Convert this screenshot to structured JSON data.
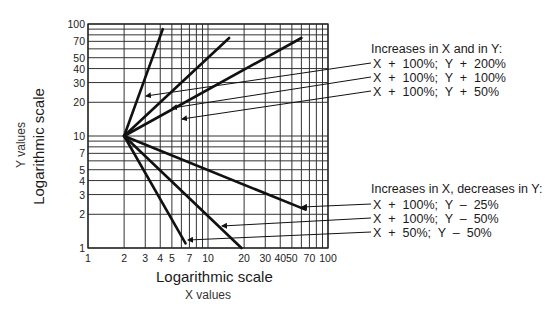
{
  "chart_data": {
    "type": "line",
    "title": "",
    "xlabel": "Logarithmic scale",
    "xsublabel": "X values",
    "ylabel": "Logarithmic scale",
    "ysublabel": "Y values",
    "xscale": "log",
    "yscale": "log",
    "xlim": [
      1,
      100
    ],
    "ylim": [
      1,
      100
    ],
    "grid": true,
    "x_ticks": [
      1,
      2,
      3,
      4,
      5,
      7,
      10,
      20,
      30,
      40,
      50,
      70,
      100
    ],
    "y_ticks": [
      1,
      2,
      3,
      4,
      5,
      7,
      10,
      20,
      30,
      40,
      50,
      70,
      100
    ],
    "x_tick_labels": [
      "1",
      "2",
      "3",
      "4",
      "5",
      "7",
      "10",
      "20",
      "30",
      "40",
      "50",
      "70",
      "100"
    ],
    "y_tick_labels": [
      "1",
      "2",
      "3",
      "4",
      "5",
      "7",
      "10",
      "20",
      "30",
      "40",
      "50",
      "70",
      "100"
    ],
    "origin": {
      "x": 2,
      "y": 10
    },
    "series": [
      {
        "name": "X + 100%; Y + 200%",
        "group": "increase",
        "x": [
          2,
          4.2
        ],
        "y": [
          10,
          90
        ]
      },
      {
        "name": "X + 100%; Y + 100%",
        "group": "increase",
        "x": [
          2,
          15
        ],
        "y": [
          10,
          75
        ]
      },
      {
        "name": "X + 100%; Y + 50%",
        "group": "increase",
        "x": [
          2,
          60
        ],
        "y": [
          10,
          75
        ]
      },
      {
        "name": "X + 100%; Y - 25%",
        "group": "decrease",
        "x": [
          2,
          65
        ],
        "y": [
          10,
          2.2
        ]
      },
      {
        "name": "X + 100%; Y - 50%",
        "group": "decrease",
        "x": [
          2,
          19
        ],
        "y": [
          10,
          1
        ]
      },
      {
        "name": "X + 50%; Y - 50%",
        "group": "decrease",
        "x": [
          2,
          6.5
        ],
        "y": [
          10,
          1.1
        ]
      }
    ],
    "annotations": [
      {
        "heading": "Increases in X and in Y:",
        "items": [
          "X  +  100%;  Y  +  200%",
          "X  +  100%;  Y  +  100%",
          "X  +  100%;  Y  +  50%"
        ]
      },
      {
        "heading": "Increases in X, decreases in Y:",
        "items": [
          "X  +  100%;  Y  –  25%",
          "X  +  100%;  Y  –  50%",
          "X  +  50%;  Y  –  50%"
        ]
      }
    ],
    "legend_position": "right"
  },
  "labels": {
    "x_title": "Logarithmic scale",
    "x_sub": "X values",
    "y_title": "Logarithmic scale",
    "y_sub": "Y values",
    "inc_heading": "Increases in X and in Y:",
    "inc_1": "X  +  100%;  Y  +  200%",
    "inc_2": "X  +  100%;  Y  +  100%",
    "inc_3": "X  +  100%;  Y  +  50%",
    "dec_heading": "Increases in X, decreases in Y:",
    "dec_1": "X  +  100%;  Y  –  25%",
    "dec_2": "X  +  100%;  Y  –  50%",
    "dec_3": "X  +  50%;  Y  –  50%"
  }
}
